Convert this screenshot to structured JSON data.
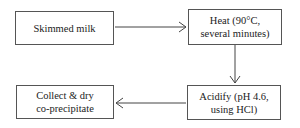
{
  "diagram": {
    "type": "flowchart",
    "nodes": [
      {
        "id": "skimmed_milk",
        "label": "Skimmed milk"
      },
      {
        "id": "heat",
        "label": "Heat (90°C,\nseveral minutes)"
      },
      {
        "id": "acidify",
        "label": "Acidify (pH 4.6,\nusing HCl)"
      },
      {
        "id": "collect",
        "label": "Collect & dry\nco-precipitate"
      }
    ],
    "edges": [
      {
        "from": "skimmed_milk",
        "to": "heat"
      },
      {
        "from": "heat",
        "to": "acidify"
      },
      {
        "from": "acidify",
        "to": "collect"
      }
    ]
  }
}
